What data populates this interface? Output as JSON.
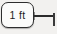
{
  "widget": {
    "name": "map-scale-bar",
    "distance_label": "1 ft",
    "colors": {
      "pill_background": "#fbfbfa",
      "pill_border": "#2e2e2e",
      "text": "#1c1c1c",
      "ruler_line": "#2b2b2b",
      "canvas_background": "#f2f1ef"
    }
  },
  "icons": {
    "ruler_line": "scale-ruler-line",
    "end_tick": "scale-end-tick"
  }
}
